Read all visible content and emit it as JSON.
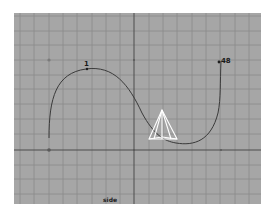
{
  "viewport": {
    "camera_label": "side",
    "background_color": "#a6a6a6",
    "grid_color": "#8a8a8a",
    "axis_color": "#4a4a4a"
  },
  "curve": {
    "color": "#3a3a3a",
    "start_label": "1",
    "end_label": "48"
  },
  "cone": {
    "color": "#ffffff"
  }
}
